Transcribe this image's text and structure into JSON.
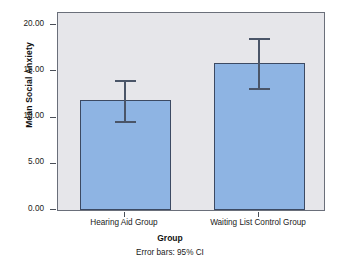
{
  "chart_data": {
    "type": "bar",
    "title": "",
    "xlabel": "Group",
    "ylabel": "Mean Social Anxiety",
    "categories": [
      "Hearing Aid Group",
      "Waiting List Control Group"
    ],
    "values": [
      11.9,
      15.9
    ],
    "error_low": [
      9.6,
      13.2
    ],
    "error_high": [
      14.1,
      18.6
    ],
    "error_bar_note": "Error bars: 95% CI",
    "ylim": [
      0,
      20
    ],
    "ytick_values": [
      0,
      5,
      10,
      15,
      20
    ],
    "ytick_labels": [
      "0.00",
      "5.00",
      "10.00",
      "15.00",
      "20.00"
    ],
    "grid": false,
    "legend": "none",
    "bar_color": "#8EB4E3",
    "bar_border_color": "#3C4A63",
    "error_bar_color": "#4A5568",
    "plot_background": "#E6E6EA",
    "page_background": "#FFFFFF"
  }
}
